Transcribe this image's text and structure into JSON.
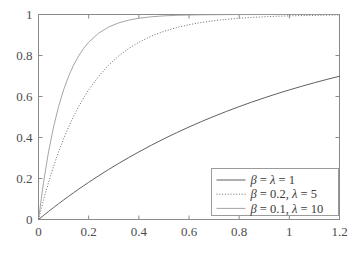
{
  "chart_data": {
    "type": "line",
    "title": "",
    "xlabel": "",
    "ylabel": "",
    "xlim": [
      0,
      1.2
    ],
    "ylim": [
      0,
      1
    ],
    "grid": false,
    "legend_position": "lower right",
    "xticks": [
      "0",
      "0.2",
      "0.4",
      "0.6",
      "0.8",
      "1",
      "1.2"
    ],
    "xtick_values": [
      0,
      0.2,
      0.4,
      0.6,
      0.8,
      1,
      1.2
    ],
    "yticks": [
      "0",
      "0.2",
      "0.4",
      "0.6",
      "0.8",
      "1"
    ],
    "ytick_values": [
      0,
      0.2,
      0.4,
      0.6,
      0.8,
      1
    ],
    "x": [
      0,
      0.02,
      0.04,
      0.06,
      0.08,
      0.1,
      0.12,
      0.14,
      0.16,
      0.18,
      0.2,
      0.24,
      0.28,
      0.32,
      0.36,
      0.4,
      0.45,
      0.5,
      0.55,
      0.6,
      0.65,
      0.7,
      0.75,
      0.8,
      0.85,
      0.9,
      0.95,
      1.0,
      1.05,
      1.1,
      1.15,
      1.2
    ],
    "series": [
      {
        "name": "beta = lambda = 1",
        "label": "β = λ = 1",
        "style": "solid",
        "color": "#4d4d4d",
        "width": 0.9,
        "values": [
          0,
          0.0198,
          0.0392,
          0.0582,
          0.0769,
          0.0952,
          0.1131,
          0.1306,
          0.1479,
          0.1647,
          0.1813,
          0.2134,
          0.2442,
          0.2739,
          0.3023,
          0.3297,
          0.3624,
          0.3935,
          0.4231,
          0.4512,
          0.478,
          0.5034,
          0.5276,
          0.5507,
          0.5726,
          0.5934,
          0.6133,
          0.6321,
          0.6501,
          0.6671,
          0.6834,
          0.6988
        ]
      },
      {
        "name": "beta = 0.2, lambda = 5",
        "label": "β = 0.2, λ = 5",
        "style": "dotted",
        "color": "#595959",
        "width": 0.9,
        "values": [
          0,
          0.0952,
          0.1813,
          0.2592,
          0.3297,
          0.3935,
          0.4512,
          0.5034,
          0.5507,
          0.5934,
          0.6321,
          0.6988,
          0.7534,
          0.7981,
          0.8347,
          0.8647,
          0.8946,
          0.9179,
          0.9362,
          0.9502,
          0.9613,
          0.9698,
          0.9765,
          0.9817,
          0.9857,
          0.9889,
          0.9914,
          0.9933,
          0.9948,
          0.9959,
          0.9968,
          0.9975
        ]
      },
      {
        "name": "beta = 0.1, lambda = 10",
        "label": "β = 0.1, λ = 10",
        "style": "solid-light",
        "color": "#9a9a9a",
        "width": 0.9,
        "values": [
          0,
          0.1813,
          0.3297,
          0.4512,
          0.5507,
          0.6321,
          0.6988,
          0.7534,
          0.7981,
          0.8347,
          0.8647,
          0.9093,
          0.9392,
          0.9592,
          0.9727,
          0.9817,
          0.9889,
          0.9933,
          0.9959,
          0.9975,
          0.9985,
          0.9991,
          0.9994,
          0.9997,
          0.9998,
          0.9999,
          0.9999,
          1.0,
          1.0,
          1.0,
          1.0,
          1.0
        ]
      }
    ],
    "legend_entries": [
      {
        "label": "β = λ = 1",
        "style": "solid",
        "color": "#4d4d4d"
      },
      {
        "label": "β = 0.2, λ = 5",
        "style": "dotted",
        "color": "#595959"
      },
      {
        "label": "β = 0.1, λ = 10",
        "style": "solid-light",
        "color": "#9a9a9a"
      }
    ]
  },
  "axes": {
    "box_color": "#8a8a8a",
    "background": "#ffffff"
  }
}
